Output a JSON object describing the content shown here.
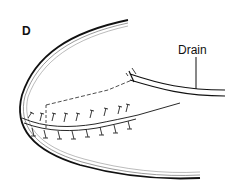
{
  "figure": {
    "panel_label": "D",
    "annotations": [
      {
        "label": "Drain"
      }
    ]
  }
}
